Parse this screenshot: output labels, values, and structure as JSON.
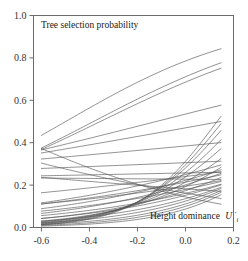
{
  "figure": {
    "background_color": "#ffffff",
    "frame_color": "#6b6b6b",
    "curve_color": "#555555",
    "width": 248,
    "height": 261
  },
  "chart_data": {
    "type": "line",
    "title": "Tree selection probability",
    "subtitle": "",
    "xlabel": "Height dominance",
    "xlabel_symbol": "U",
    "xlabel_symbol_sup": "′",
    "xlabel_symbol_sub": "i",
    "ylabel": "",
    "xlim": [
      -0.633,
      0.2
    ],
    "ylim": [
      0.0,
      1.0
    ],
    "xticks": [
      -0.6,
      -0.4,
      -0.2,
      0.0,
      0.2
    ],
    "xtick_labels": [
      "-0.6",
      "-0.4",
      "-0.2",
      "0.0",
      "0.2"
    ],
    "yticks": [
      0.0,
      0.2,
      0.4,
      0.6,
      0.8,
      1.0
    ],
    "ytick_labels": [
      "0.0",
      "0.2",
      "0.4",
      "0.6",
      "0.8",
      "1.0"
    ],
    "grid": false,
    "legend": false,
    "legend_position": "none",
    "x_data_range": [
      -0.6,
      0.148
    ],
    "series_count": 34,
    "series_note": "Each line is a logistic tree-selection probability curve for one stand/plot; curves are drawn in the same grey.",
    "series": [
      {
        "name": "curve-01",
        "x": [
          -0.6,
          0.148
        ],
        "intercept": 1.297,
        "slope": 2.6,
        "y_start": 0.785,
        "y_end": 0.848
      },
      {
        "name": "curve-02",
        "x": [
          -0.6,
          0.148
        ],
        "intercept": 0.9,
        "slope": 2.35,
        "y_start": 0.633,
        "y_end": 0.779
      },
      {
        "name": "curve-03",
        "x": [
          -0.6,
          0.148
        ],
        "intercept": 0.78,
        "slope": 2.2,
        "y_start": 0.611,
        "y_end": 0.753
      },
      {
        "name": "curve-04",
        "x": [
          -0.6,
          0.148
        ],
        "intercept": 0.14,
        "slope": 1.15,
        "y_start": 0.389,
        "y_end": 0.576
      },
      {
        "name": "curve-05",
        "x": [
          -0.6,
          0.148
        ],
        "intercept": -0.12,
        "slope": 0.82,
        "y_start": 0.352,
        "y_end": 0.5
      },
      {
        "name": "curve-06",
        "x": [
          -0.6,
          0.148
        ],
        "intercept": -0.47,
        "slope": 0.45,
        "y_start": 0.316,
        "y_end": 0.4
      },
      {
        "name": "curve-07",
        "x": [
          -0.6,
          0.148
        ],
        "intercept": -0.82,
        "slope": 0.22,
        "y_start": 0.268,
        "y_end": 0.311
      },
      {
        "name": "curve-08",
        "x": [
          -0.6,
          0.148
        ],
        "intercept": -1.06,
        "slope": 0.12,
        "y_start": 0.234,
        "y_end": 0.258
      },
      {
        "name": "curve-09",
        "x": [
          -0.6,
          0.148
        ],
        "intercept": -1.22,
        "slope": -0.05,
        "y_start": 0.226,
        "y_end": 0.216
      },
      {
        "name": "curve-10",
        "x": [
          -0.6,
          0.148
        ],
        "intercept": -1.5,
        "slope": -0.55,
        "y_start": 0.253,
        "y_end": 0.166
      },
      {
        "name": "curve-11",
        "x": [
          -0.6,
          0.148
        ],
        "intercept": -1.64,
        "slope": -1.35,
        "y_start": 0.303,
        "y_end": 0.138
      },
      {
        "name": "curve-12",
        "x": [
          -0.6,
          0.148
        ],
        "intercept": -1.78,
        "slope": -2.1,
        "y_start": 0.376,
        "y_end": 0.11
      },
      {
        "name": "curve-13",
        "x": [
          -0.6,
          0.148
        ],
        "intercept": -1.1,
        "slope": 1.55,
        "y_start": 0.11,
        "y_end": 0.294
      },
      {
        "name": "curve-14",
        "x": [
          -0.6,
          0.148
        ],
        "intercept": -1.3,
        "slope": 1.3,
        "y_start": 0.103,
        "y_end": 0.246
      },
      {
        "name": "curve-15",
        "x": [
          -0.6,
          0.148
        ],
        "intercept": -1.42,
        "slope": 1.1,
        "y_start": 0.104,
        "y_end": 0.22
      },
      {
        "name": "curve-16",
        "x": [
          -0.6,
          0.148
        ],
        "intercept": -1.52,
        "slope": 1.6,
        "y_start": 0.08,
        "y_end": 0.218
      },
      {
        "name": "curve-17",
        "x": [
          -0.6,
          0.148
        ],
        "intercept": -1.65,
        "slope": 1.95,
        "y_start": 0.063,
        "y_end": 0.209
      },
      {
        "name": "curve-18",
        "x": [
          -0.6,
          0.148
        ],
        "intercept": -1.72,
        "slope": 2.3,
        "y_start": 0.053,
        "y_end": 0.209
      },
      {
        "name": "curve-19",
        "x": [
          -0.6,
          0.148
        ],
        "intercept": -1.85,
        "slope": 2.7,
        "y_start": 0.042,
        "y_end": 0.195
      },
      {
        "name": "curve-20",
        "x": [
          -0.6,
          0.148
        ],
        "intercept": -1.95,
        "slope": 3.1,
        "y_start": 0.033,
        "y_end": 0.184
      },
      {
        "name": "curve-21",
        "x": [
          -0.6,
          0.148
        ],
        "intercept": -2.08,
        "slope": 3.55,
        "y_start": 0.024,
        "y_end": 0.172
      },
      {
        "name": "curve-22",
        "x": [
          -0.6,
          0.148
        ],
        "intercept": -2.2,
        "slope": 3.95,
        "y_start": 0.018,
        "y_end": 0.164
      },
      {
        "name": "curve-23",
        "x": [
          -0.6,
          0.148
        ],
        "intercept": -2.35,
        "slope": 4.4,
        "y_start": 0.013,
        "y_end": 0.153
      },
      {
        "name": "curve-24",
        "x": [
          -0.6,
          0.148
        ],
        "intercept": -1.43,
        "slope": 3.4,
        "y_start": 0.031,
        "y_end": 0.285
      },
      {
        "name": "curve-25",
        "x": [
          -0.6,
          0.148
        ],
        "intercept": -1.3,
        "slope": 3.85,
        "y_start": 0.029,
        "y_end": 0.325
      },
      {
        "name": "curve-26",
        "x": [
          -0.6,
          0.148
        ],
        "intercept": -1.16,
        "slope": 4.3,
        "y_start": 0.029,
        "y_end": 0.375
      },
      {
        "name": "curve-27",
        "x": [
          -0.6,
          0.148
        ],
        "intercept": -1.05,
        "slope": 4.75,
        "y_start": 0.022,
        "y_end": 0.415
      },
      {
        "name": "curve-28",
        "x": [
          -0.6,
          0.148
        ],
        "intercept": -0.94,
        "slope": 5.2,
        "y_start": 0.017,
        "y_end": 0.457
      },
      {
        "name": "curve-29",
        "x": [
          -0.6,
          0.148
        ],
        "intercept": -0.87,
        "slope": 5.6,
        "y_start": 0.013,
        "y_end": 0.481
      },
      {
        "name": "curve-30",
        "x": [
          -0.6,
          0.148
        ],
        "intercept": -0.79,
        "slope": 6.0,
        "y_start": 0.01,
        "y_end": 0.512
      },
      {
        "name": "curve-31",
        "x": [
          -0.6,
          0.148
        ],
        "intercept": -1.56,
        "slope": 2.6,
        "y_start": 0.042,
        "y_end": 0.232
      },
      {
        "name": "curve-32",
        "x": [
          -0.6,
          0.148
        ],
        "intercept": -1.38,
        "slope": 2.1,
        "y_start": 0.066,
        "y_end": 0.258
      },
      {
        "name": "curve-33",
        "x": [
          -0.6,
          0.148
        ],
        "intercept": -1.25,
        "slope": 1.8,
        "y_start": 0.087,
        "y_end": 0.272
      },
      {
        "name": "curve-34",
        "x": [
          -0.6,
          0.148
        ],
        "intercept": -1.15,
        "slope": 0.8,
        "y_start": 0.163,
        "y_end": 0.259
      }
    ]
  }
}
